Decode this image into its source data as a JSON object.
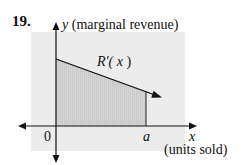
{
  "problem_number": "19.",
  "axes": {
    "y_label_var": "y",
    "y_label_desc": "(marginal revenue)",
    "x_label_var": "x",
    "x_label_desc": "(units sold)",
    "origin_label": "0",
    "a_label": "a"
  },
  "curve": {
    "label_prefix": "R′(",
    "label_var": "x",
    "label_suffix": ")"
  },
  "colors": {
    "panel": "#ececec",
    "shaded_region": "#d6d6d6",
    "ink": "#111111"
  }
}
